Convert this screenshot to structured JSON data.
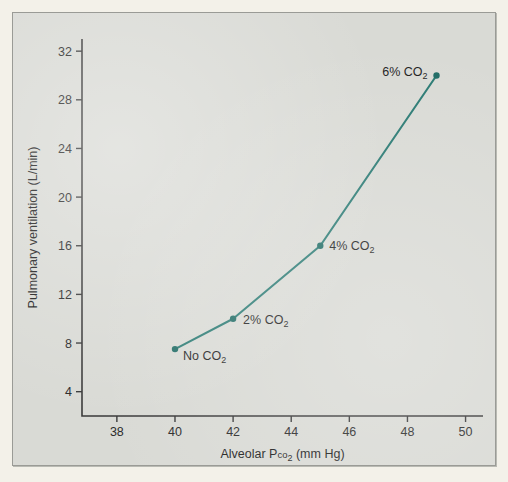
{
  "chart_data": {
    "type": "line",
    "title": "",
    "xlabel": "Alveolar Pco2 (mm Hg)",
    "ylabel": "Pulmonary ventilation (L/min)",
    "xlim": [
      36.8,
      50.6
    ],
    "ylim": [
      2.0,
      33.0
    ],
    "xticks": [
      38,
      40,
      42,
      44,
      46,
      48,
      50
    ],
    "yticks": [
      4,
      8,
      12,
      16,
      20,
      24,
      28,
      32
    ],
    "xtick_labels": [
      "38",
      "40",
      "42",
      "44",
      "46",
      "48",
      "50"
    ],
    "ytick_labels": [
      "4",
      "8",
      "12",
      "16",
      "20",
      "24",
      "28",
      "32"
    ],
    "grid": false,
    "legend": "none",
    "line_color": "#2a7a73",
    "marker_color": "#1f6b64",
    "series": [
      {
        "name": "Alveolar Pco2 vs pulmonary ventilation",
        "x": [
          40,
          42,
          45,
          49
        ],
        "y": [
          7.5,
          10.0,
          16.0,
          30.0
        ],
        "point_labels": [
          "No CO2",
          "2% CO2",
          "4% CO2",
          "6% CO2"
        ]
      }
    ],
    "annotations": [
      {
        "text_main": "No CO",
        "sub": "2",
        "x": 40,
        "y": 7.5,
        "anchor": "start",
        "dx": 8,
        "dy": 11
      },
      {
        "text_main": "2% CO",
        "sub": "2",
        "x": 42,
        "y": 10.0,
        "anchor": "start",
        "dx": 10,
        "dy": 5
      },
      {
        "text_main": "4% CO",
        "sub": "2",
        "x": 45,
        "y": 16.0,
        "anchor": "start",
        "dx": 9,
        "dy": 4
      },
      {
        "text_main": "6% CO",
        "sub": "2",
        "x": 49,
        "y": 30.0,
        "anchor": "end",
        "dx": -9,
        "dy": 1
      }
    ],
    "axis_title_x_parts": {
      "lead": "Alveolar P",
      "smallcaps": "co",
      "sub": "2",
      "tail": " (mm Hg)"
    }
  },
  "figure": {
    "background_color": "#f3f1e9",
    "panel_color": "#d9dad5",
    "frame_color": "#9a9b96"
  }
}
